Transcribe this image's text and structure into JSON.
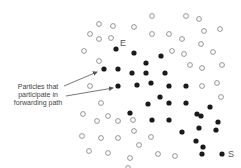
{
  "labels": {
    "start": "E",
    "end": "S",
    "annotation": [
      "Particles that",
      "participate in",
      "forwarding path"
    ]
  },
  "colors": {
    "filled": "#1a1a1a",
    "open_stroke": "#8a8a8a",
    "arrow": "#555555"
  },
  "particles": {
    "filled": [
      [
        116,
        49
      ],
      [
        134,
        53
      ],
      [
        161,
        56
      ],
      [
        146,
        63
      ],
      [
        104,
        69
      ],
      [
        118,
        69
      ],
      [
        132,
        73
      ],
      [
        146,
        73
      ],
      [
        165,
        73
      ],
      [
        118,
        86
      ],
      [
        137,
        85
      ],
      [
        151,
        83
      ],
      [
        169,
        86
      ],
      [
        186,
        86
      ],
      [
        160,
        97
      ],
      [
        148,
        104
      ],
      [
        169,
        103
      ],
      [
        186,
        103
      ],
      [
        130,
        113
      ],
      [
        210,
        107
      ],
      [
        152,
        120
      ],
      [
        169,
        120
      ],
      [
        197,
        114
      ],
      [
        201,
        116
      ],
      [
        182,
        132
      ],
      [
        199,
        128
      ],
      [
        218,
        122
      ],
      [
        216,
        130
      ],
      [
        203,
        147
      ],
      [
        196,
        141
      ],
      [
        222,
        154
      ],
      [
        202,
        154
      ]
    ],
    "open": [
      [
        99,
        24
      ],
      [
        113,
        26
      ],
      [
        90,
        34
      ],
      [
        99,
        39
      ],
      [
        111,
        38
      ],
      [
        84,
        51
      ],
      [
        152,
        16
      ],
      [
        134,
        27
      ],
      [
        152,
        34
      ],
      [
        169,
        34
      ],
      [
        182,
        39
      ],
      [
        172,
        51
      ],
      [
        184,
        54
      ],
      [
        186,
        16
      ],
      [
        199,
        19
      ],
      [
        204,
        31
      ],
      [
        220,
        29
      ],
      [
        201,
        44
      ],
      [
        213,
        52
      ],
      [
        99,
        61
      ],
      [
        90,
        86
      ],
      [
        101,
        103
      ],
      [
        190,
        65
      ],
      [
        202,
        68
      ],
      [
        222,
        65
      ],
      [
        202,
        86
      ],
      [
        217,
        83
      ],
      [
        221,
        97
      ],
      [
        83,
        114
      ],
      [
        97,
        121
      ],
      [
        108,
        116
      ],
      [
        118,
        121
      ],
      [
        82,
        136
      ],
      [
        101,
        138
      ],
      [
        118,
        138
      ],
      [
        89,
        151
      ],
      [
        108,
        153
      ],
      [
        133,
        120
      ],
      [
        134,
        131
      ],
      [
        151,
        137
      ],
      [
        139,
        145
      ],
      [
        130,
        158
      ],
      [
        158,
        154
      ],
      [
        175,
        156
      ],
      [
        128,
        168
      ]
    ]
  },
  "arrows": [
    {
      "from": [
        64,
        86
      ],
      "to": [
        97,
        72
      ]
    },
    {
      "from": [
        66,
        96
      ],
      "to": [
        113,
        88
      ]
    }
  ]
}
